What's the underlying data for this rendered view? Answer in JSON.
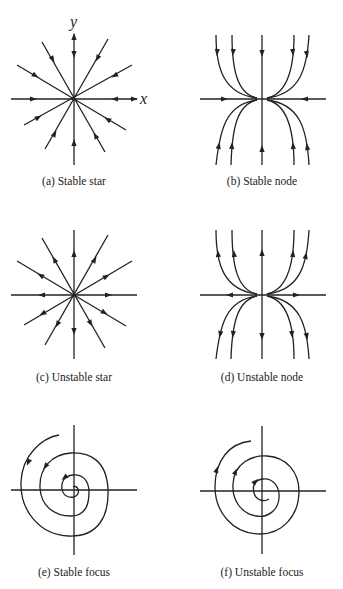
{
  "figure": {
    "axis_labels": {
      "x": "x",
      "y": "y"
    },
    "panels": [
      {
        "id": "a",
        "caption": "(a) Stable star",
        "type": "star",
        "stability": "stable"
      },
      {
        "id": "b",
        "caption": "(b) Stable node",
        "type": "node",
        "stability": "stable"
      },
      {
        "id": "c",
        "caption": "(c) Unstable star",
        "type": "star",
        "stability": "unstable"
      },
      {
        "id": "d",
        "caption": "(d) Unstable node",
        "type": "node",
        "stability": "unstable"
      },
      {
        "id": "e",
        "caption": "(e) Stable focus",
        "type": "focus",
        "stability": "stable"
      },
      {
        "id": "f",
        "caption": "(f) Unstable focus",
        "type": "focus",
        "stability": "unstable"
      }
    ],
    "colors": {
      "ink": "#222222",
      "background": "#ffffff"
    }
  }
}
